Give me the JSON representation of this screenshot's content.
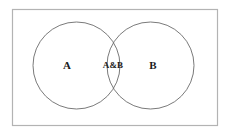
{
  "figure": {
    "type": "venn-diagram",
    "background_color": "#ffffff"
  },
  "universe": {
    "name": "universal-set-rectangle",
    "stroke_color": "#b3b3b3",
    "stroke_width": 1.2,
    "x": 12.5,
    "y": 9.5,
    "width": 205,
    "height": 116,
    "fill": "none"
  },
  "circles": [
    {
      "id": "circle-a",
      "label": "A",
      "cx": 76.5,
      "cy": 65.5,
      "r": 43.5,
      "stroke_color": "#6b6b6b",
      "stroke_width": 0.9,
      "fill": "none"
    },
    {
      "id": "circle-b",
      "label": "B",
      "cx": 150.5,
      "cy": 65.5,
      "r": 43.5,
      "stroke_color": "#6b6b6b",
      "stroke_width": 0.9,
      "fill": "none"
    }
  ],
  "labels": [
    {
      "id": "label-a",
      "name": "set-a-label",
      "text": "A",
      "x": 67,
      "y": 66,
      "color": "#1b1b1b"
    },
    {
      "id": "label-ab",
      "name": "intersection-label",
      "text": "A&B",
      "x": 113,
      "y": 66,
      "color": "#1b1b1b"
    },
    {
      "id": "label-b",
      "name": "set-b-label",
      "text": "B",
      "x": 153,
      "y": 66,
      "color": "#1b1b1b"
    }
  ],
  "chart_data": {
    "type": "diagram",
    "diagram_type": "venn",
    "sets": [
      "A",
      "B"
    ],
    "regions": [
      {
        "region": "A only",
        "label": "A"
      },
      {
        "region": "A intersect B",
        "label": "A&B"
      },
      {
        "region": "B only",
        "label": "B"
      }
    ],
    "title": "",
    "legend": []
  }
}
